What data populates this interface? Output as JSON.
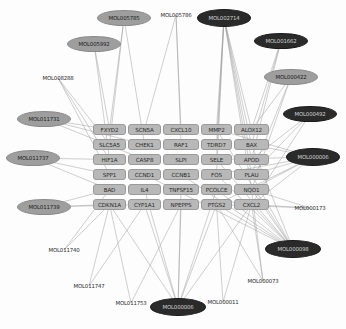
{
  "graph": {
    "type": "network-diagram",
    "title": "Compound-target interaction network",
    "edge_color": "#9b9b9b",
    "gene_node_color": "#b8b8b8",
    "compound_light_color": "#9e9e9e",
    "compound_dark_color": "#2a2a2a",
    "background": "#fdfdfd"
  },
  "genes": [
    {
      "id": "FXYD2",
      "x": 93,
      "y": 124,
      "w": 33,
      "h": 11
    },
    {
      "id": "SCN5A",
      "x": 128,
      "y": 124,
      "w": 33,
      "h": 11
    },
    {
      "id": "CXCL10",
      "x": 163,
      "y": 124,
      "w": 36,
      "h": 11
    },
    {
      "id": "MMP2",
      "x": 201,
      "y": 124,
      "w": 31,
      "h": 11
    },
    {
      "id": "ALOX12",
      "x": 234,
      "y": 124,
      "w": 35,
      "h": 11
    },
    {
      "id": "SLC5A5",
      "x": 93,
      "y": 139,
      "w": 33,
      "h": 11
    },
    {
      "id": "CHEK1",
      "x": 128,
      "y": 139,
      "w": 33,
      "h": 11
    },
    {
      "id": "RAF1",
      "x": 163,
      "y": 139,
      "w": 36,
      "h": 11
    },
    {
      "id": "TDRD7",
      "x": 201,
      "y": 139,
      "w": 31,
      "h": 11
    },
    {
      "id": "BAX",
      "x": 234,
      "y": 139,
      "w": 35,
      "h": 11
    },
    {
      "id": "HIF1A",
      "x": 93,
      "y": 154,
      "w": 33,
      "h": 11
    },
    {
      "id": "CASP8",
      "x": 128,
      "y": 154,
      "w": 33,
      "h": 11
    },
    {
      "id": "SLPI",
      "x": 163,
      "y": 154,
      "w": 36,
      "h": 11
    },
    {
      "id": "SELE",
      "x": 201,
      "y": 154,
      "w": 31,
      "h": 11
    },
    {
      "id": "APOD",
      "x": 234,
      "y": 154,
      "w": 35,
      "h": 11
    },
    {
      "id": "SPP1",
      "x": 93,
      "y": 169,
      "w": 33,
      "h": 11
    },
    {
      "id": "CCND1",
      "x": 128,
      "y": 169,
      "w": 33,
      "h": 11
    },
    {
      "id": "CCNB1",
      "x": 163,
      "y": 169,
      "w": 36,
      "h": 11
    },
    {
      "id": "FOS",
      "x": 201,
      "y": 169,
      "w": 31,
      "h": 11
    },
    {
      "id": "PLAU",
      "x": 234,
      "y": 169,
      "w": 35,
      "h": 11
    },
    {
      "id": "BAD",
      "x": 93,
      "y": 184,
      "w": 33,
      "h": 11
    },
    {
      "id": "IL4",
      "x": 128,
      "y": 184,
      "w": 33,
      "h": 11
    },
    {
      "id": "TNFSF15",
      "x": 163,
      "y": 184,
      "w": 36,
      "h": 11
    },
    {
      "id": "PCOLCE",
      "x": 201,
      "y": 184,
      "w": 31,
      "h": 11
    },
    {
      "id": "NQO1",
      "x": 234,
      "y": 184,
      "w": 35,
      "h": 11
    },
    {
      "id": "CDKN1A",
      "x": 93,
      "y": 199,
      "w": 33,
      "h": 11
    },
    {
      "id": "CYP1A1",
      "x": 128,
      "y": 199,
      "w": 33,
      "h": 11
    },
    {
      "id": "NPEPPS",
      "x": 163,
      "y": 199,
      "w": 36,
      "h": 11
    },
    {
      "id": "PTGS2",
      "x": 201,
      "y": 199,
      "w": 31,
      "h": 11
    },
    {
      "id": "CXCL2",
      "x": 234,
      "y": 199,
      "w": 35,
      "h": 11
    }
  ],
  "compounds": [
    {
      "id": "MOL005785",
      "cx": 124,
      "cy": 18,
      "rx": 27,
      "ry": 8,
      "style": "light"
    },
    {
      "id": "MOL005786",
      "cx": 176,
      "cy": 15,
      "rx": 27,
      "ry": 8,
      "style": "plain"
    },
    {
      "id": "MOL002714",
      "cx": 224,
      "cy": 18,
      "rx": 27,
      "ry": 9,
      "style": "dark"
    },
    {
      "id": "MOL005992",
      "cx": 94,
      "cy": 44,
      "rx": 27,
      "ry": 8,
      "style": "light"
    },
    {
      "id": "MOL001662",
      "cx": 281,
      "cy": 41,
      "rx": 27,
      "ry": 8,
      "style": "dark"
    },
    {
      "id": "MOL008288",
      "cx": 58,
      "cy": 78,
      "rx": 27,
      "ry": 8,
      "style": "plain"
    },
    {
      "id": "MOL000422",
      "cx": 291,
      "cy": 77,
      "rx": 27,
      "ry": 8,
      "style": "light"
    },
    {
      "id": "MOL011731",
      "cx": 44,
      "cy": 119,
      "rx": 27,
      "ry": 8,
      "style": "light"
    },
    {
      "id": "MOL000492",
      "cx": 310,
      "cy": 114,
      "rx": 27,
      "ry": 8,
      "style": "dark"
    },
    {
      "id": "MOL011737",
      "cx": 33,
      "cy": 158,
      "rx": 27,
      "ry": 8,
      "style": "light"
    },
    {
      "id": "MOL000006",
      "cx": 313,
      "cy": 157,
      "rx": 27,
      "ry": 9,
      "style": "dark"
    },
    {
      "id": "MOL011739",
      "cx": 44,
      "cy": 207,
      "rx": 27,
      "ry": 8,
      "style": "light"
    },
    {
      "id": "MOL000173",
      "cx": 310,
      "cy": 208,
      "rx": 27,
      "ry": 8,
      "style": "plain"
    },
    {
      "id": "MOL011740",
      "cx": 64,
      "cy": 250,
      "rx": 27,
      "ry": 8,
      "style": "plain"
    },
    {
      "id": "MOL000098",
      "cx": 293,
      "cy": 249,
      "rx": 28,
      "ry": 9,
      "style": "dark"
    },
    {
      "id": "MOL011747",
      "cx": 89,
      "cy": 286,
      "rx": 27,
      "ry": 8,
      "style": "plain"
    },
    {
      "id": "MOL011753",
      "cx": 131,
      "cy": 303,
      "rx": 27,
      "ry": 8,
      "style": "plain"
    },
    {
      "id": "MOL000006b",
      "cx": 178,
      "cy": 307,
      "rx": 28,
      "ry": 9,
      "style": "dark",
      "label": "MOL000006"
    },
    {
      "id": "MOL000011",
      "cx": 223,
      "cy": 302,
      "rx": 27,
      "ry": 8,
      "style": "plain"
    },
    {
      "id": "MOL000073",
      "cx": 263,
      "cy": 281,
      "rx": 27,
      "ry": 8,
      "style": "plain"
    }
  ],
  "edges": [
    [
      "MOL005785",
      "FXYD2"
    ],
    [
      "MOL005785",
      "SLC5A5"
    ],
    [
      "MOL005785",
      "CHEK1"
    ],
    [
      "MOL005786",
      "SCN5A"
    ],
    [
      "MOL005786",
      "CXCL10"
    ],
    [
      "MOL005786",
      "RAF1"
    ],
    [
      "MOL002714",
      "MMP2"
    ],
    [
      "MOL002714",
      "ALOX12"
    ],
    [
      "MOL002714",
      "TDRD7"
    ],
    [
      "MOL002714",
      "BAX"
    ],
    [
      "MOL002714",
      "SELE"
    ],
    [
      "MOL002714",
      "APOD"
    ],
    [
      "MOL002714",
      "FOS"
    ],
    [
      "MOL002714",
      "PLAU"
    ],
    [
      "MOL002714",
      "NQO1"
    ],
    [
      "MOL005992",
      "FXYD2"
    ],
    [
      "MOL005992",
      "HIF1A"
    ],
    [
      "MOL001662",
      "ALOX12"
    ],
    [
      "MOL001662",
      "BAX"
    ],
    [
      "MOL001662",
      "APOD"
    ],
    [
      "MOL008288",
      "SLC5A5"
    ],
    [
      "MOL008288",
      "HIF1A"
    ],
    [
      "MOL008288",
      "SPP1"
    ],
    [
      "MOL000422",
      "ALOX12"
    ],
    [
      "MOL000422",
      "PLAU"
    ],
    [
      "MOL000422",
      "NQO1"
    ],
    [
      "MOL011731",
      "FXYD2"
    ],
    [
      "MOL011731",
      "CHEK1"
    ],
    [
      "MOL011731",
      "CASP8"
    ],
    [
      "MOL000492",
      "APOD"
    ],
    [
      "MOL000492",
      "PLAU"
    ],
    [
      "MOL000492",
      "CXCL2"
    ],
    [
      "MOL011737",
      "HIF1A"
    ],
    [
      "MOL011737",
      "SPP1"
    ],
    [
      "MOL011737",
      "BAD"
    ],
    [
      "MOL000006",
      "MMP2"
    ],
    [
      "MOL000006",
      "BAX"
    ],
    [
      "MOL000006",
      "SELE"
    ],
    [
      "MOL000006",
      "FOS"
    ],
    [
      "MOL000006",
      "PLAU"
    ],
    [
      "MOL000006",
      "NQO1"
    ],
    [
      "MOL000006",
      "CXCL2"
    ],
    [
      "MOL000006",
      "PTGS2"
    ],
    [
      "MOL011739",
      "BAD"
    ],
    [
      "MOL011739",
      "CDKN1A"
    ],
    [
      "MOL011739",
      "CYP1A1"
    ],
    [
      "MOL000173",
      "CXCL2"
    ],
    [
      "MOL000173",
      "NQO1"
    ],
    [
      "MOL000173",
      "PTGS2"
    ],
    [
      "MOL011740",
      "CDKN1A"
    ],
    [
      "MOL011740",
      "BAD"
    ],
    [
      "MOL000098",
      "MMP2"
    ],
    [
      "MOL000098",
      "BAX"
    ],
    [
      "MOL000098",
      "SELE"
    ],
    [
      "MOL000098",
      "FOS"
    ],
    [
      "MOL000098",
      "PLAU"
    ],
    [
      "MOL000098",
      "NQO1"
    ],
    [
      "MOL000098",
      "CXCL2"
    ],
    [
      "MOL000098",
      "PTGS2"
    ],
    [
      "MOL000098",
      "PCOLCE"
    ],
    [
      "MOL000098",
      "CCNB1"
    ],
    [
      "MOL000098",
      "CCND1"
    ],
    [
      "MOL011747",
      "CDKN1A"
    ],
    [
      "MOL011747",
      "CYP1A1"
    ],
    [
      "MOL011753",
      "CDKN1A"
    ],
    [
      "MOL011753",
      "NPEPPS"
    ],
    [
      "MOL000006b",
      "CDKN1A"
    ],
    [
      "MOL000006b",
      "CYP1A1"
    ],
    [
      "MOL000006b",
      "NPEPPS"
    ],
    [
      "MOL000006b",
      "PTGS2"
    ],
    [
      "MOL000006b",
      "CXCL2"
    ],
    [
      "MOL000006b",
      "IL4"
    ],
    [
      "MOL000006b",
      "TNFSF15"
    ],
    [
      "MOL000006b",
      "PCOLCE"
    ],
    [
      "MOL000011",
      "PTGS2"
    ],
    [
      "MOL000011",
      "CXCL2"
    ],
    [
      "MOL000073",
      "CXCL2"
    ],
    [
      "MOL000073",
      "NQO1"
    ],
    [
      "MOL000073",
      "PTGS2"
    ]
  ]
}
